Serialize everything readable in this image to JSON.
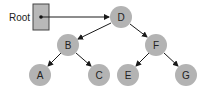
{
  "diagram": {
    "type": "binary-tree",
    "root_pointer": {
      "label": "Root",
      "box_fill": "#b8b8b8",
      "box_stroke": "#444444"
    },
    "node_fill": "#b3b3b3",
    "edge_color": "#1a1a1a",
    "nodes": [
      {
        "id": "D",
        "label": "D",
        "cx": 121,
        "cy": 17
      },
      {
        "id": "B",
        "label": "B",
        "cx": 68,
        "cy": 45
      },
      {
        "id": "F",
        "label": "F",
        "cx": 156,
        "cy": 45
      },
      {
        "id": "A",
        "label": "A",
        "cx": 40,
        "cy": 75
      },
      {
        "id": "C",
        "label": "C",
        "cx": 99,
        "cy": 75
      },
      {
        "id": "E",
        "label": "E",
        "cx": 128,
        "cy": 75
      },
      {
        "id": "G",
        "label": "G",
        "cx": 186,
        "cy": 75
      }
    ],
    "edges": [
      {
        "from": "Root",
        "to": "D"
      },
      {
        "from": "D",
        "to": "B"
      },
      {
        "from": "D",
        "to": "F"
      },
      {
        "from": "B",
        "to": "A"
      },
      {
        "from": "B",
        "to": "C"
      },
      {
        "from": "F",
        "to": "E"
      },
      {
        "from": "F",
        "to": "G"
      }
    ]
  }
}
